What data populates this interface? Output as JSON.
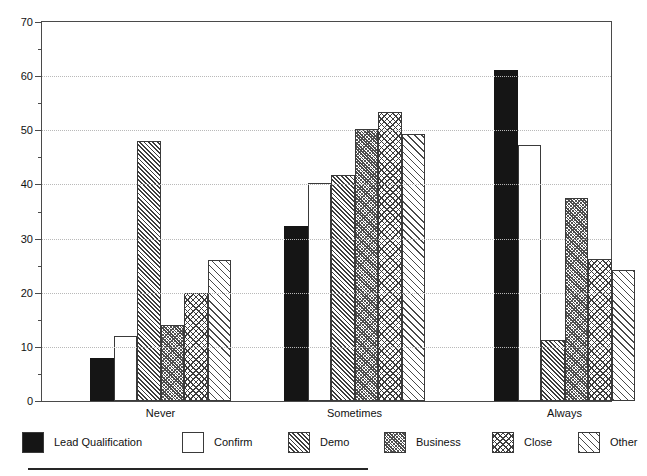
{
  "chart_data": {
    "type": "bar",
    "title": "",
    "subtitle": "",
    "xlabel": "",
    "ylabel": "",
    "categories": [
      "Never",
      "Sometimes",
      "Always"
    ],
    "series": [
      {
        "name": "Lead Qualification",
        "pattern": "solid-black",
        "values": [
          8,
          32.3,
          61.2
        ]
      },
      {
        "name": "Confirm",
        "pattern": "empty-white",
        "values": [
          12,
          40.3,
          47.3
        ]
      },
      {
        "name": "Demo",
        "pattern": "diagonal-hatch-dense",
        "values": [
          48,
          41.8,
          11.3
        ]
      },
      {
        "name": "Business",
        "pattern": "gray-stipple",
        "values": [
          14,
          50.3,
          37.5
        ]
      },
      {
        "name": "Close",
        "pattern": "crosshatch",
        "values": [
          20,
          53.3,
          26.2
        ]
      },
      {
        "name": "Other",
        "pattern": "diagonal-hatch-light",
        "values": [
          26,
          49.3,
          24.2
        ]
      }
    ],
    "ylim": [
      0,
      70
    ],
    "y_major_ticks": [
      0,
      10,
      20,
      30,
      40,
      50,
      60,
      70
    ],
    "y_minor_ticks": [
      5,
      15,
      25,
      35,
      45,
      55,
      65
    ],
    "y_tick_labels": [
      "0",
      "10",
      "20",
      "30",
      "40",
      "50",
      "60",
      "70"
    ],
    "grid": "horizontal-dotted",
    "legend_position": "bottom",
    "axis_color": "#4a4a4a",
    "grid_color": "#b9b9b9",
    "bar_edge_color": "#3a3a3a"
  }
}
